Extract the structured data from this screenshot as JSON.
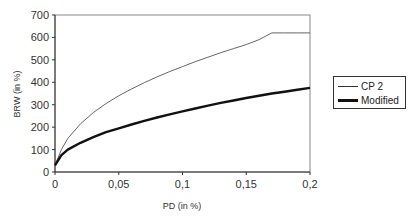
{
  "chart_data": {
    "type": "line",
    "title": "",
    "xlabel": "PD (in %)",
    "ylabel": "BRW (in %)",
    "xlim": [
      0,
      0.2
    ],
    "ylim": [
      0,
      700
    ],
    "x_ticks": [
      "0",
      "0,05",
      "0,1",
      "0,15",
      "0,2"
    ],
    "y_ticks": [
      "0",
      "100",
      "200",
      "300",
      "400",
      "500",
      "600",
      "700"
    ],
    "grid": false,
    "legend_position": "right",
    "x": [
      0,
      0.005,
      0.01,
      0.02,
      0.03,
      0.04,
      0.05,
      0.06,
      0.07,
      0.08,
      0.09,
      0.1,
      0.11,
      0.12,
      0.13,
      0.14,
      0.15,
      0.16,
      0.17,
      0.18,
      0.19,
      0.2
    ],
    "series": [
      {
        "name": "CP 2",
        "style": "thin",
        "color": "#555555",
        "values": [
          30,
          100,
          150,
          215,
          265,
          305,
          340,
          370,
          398,
          424,
          448,
          470,
          492,
          512,
          532,
          550,
          568,
          590,
          620,
          620,
          620,
          620
        ]
      },
      {
        "name": "Modified",
        "style": "thick",
        "color": "#111111",
        "values": [
          30,
          75,
          100,
          130,
          155,
          178,
          195,
          212,
          228,
          243,
          257,
          270,
          283,
          296,
          308,
          319,
          330,
          340,
          350,
          358,
          367,
          375
        ]
      }
    ]
  },
  "legend": {
    "items": [
      {
        "label": "CP 2"
      },
      {
        "label": "Modified"
      }
    ]
  }
}
